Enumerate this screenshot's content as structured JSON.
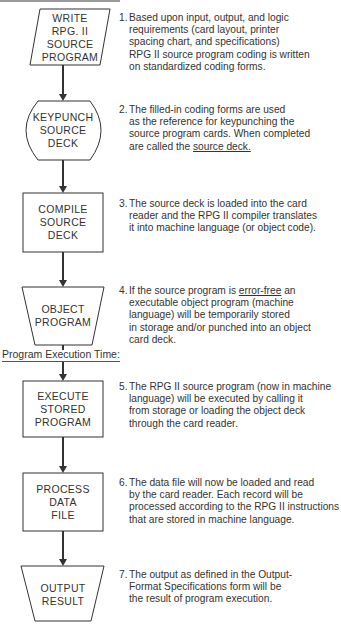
{
  "flowchart": {
    "shapes": [
      {
        "id": "write",
        "type": "parallelogram",
        "lines": [
          "WRITE",
          "RPG. II",
          "SOURCE",
          "PROGRAM"
        ]
      },
      {
        "id": "keypunch",
        "type": "offline-storage",
        "lines": [
          "KEYPUNCH",
          "SOURCE",
          "DECK"
        ]
      },
      {
        "id": "compile",
        "type": "rectangle",
        "lines": [
          "COMPILE",
          "SOURCE",
          "DECK"
        ]
      },
      {
        "id": "object",
        "type": "trapezoid",
        "lines": [
          "OBJECT",
          "PROGRAM"
        ]
      },
      {
        "id": "execute",
        "type": "rectangle",
        "lines": [
          "EXECUTE",
          "STORED",
          "PROGRAM"
        ]
      },
      {
        "id": "process",
        "type": "rectangle",
        "lines": [
          "PROCESS",
          "DATA",
          "FILE"
        ]
      },
      {
        "id": "output",
        "type": "trapezoid",
        "lines": [
          "OUTPUT",
          "RESULT"
        ]
      }
    ],
    "section_label": "Program Execution Time:",
    "line_color": "#333333"
  },
  "steps": [
    {
      "num": "1.",
      "lines": [
        "Based upon input, output, and logic",
        "requirements (card layout, printer",
        "spacing chart, and specifications)",
        "RPG II source program coding is written",
        "on standardized coding forms."
      ]
    },
    {
      "num": "2.",
      "lines": [
        "The filled-in coding forms are used",
        "as the reference for keypunching the",
        "source program cards. When completed"
      ],
      "last_prefix": "are called the ",
      "last_underlined": "source deck."
    },
    {
      "num": "3.",
      "lines": [
        "The source deck is loaded into the card",
        "reader and the RPG II compiler translates",
        "it into machine language (or object code)."
      ]
    },
    {
      "num": "4.",
      "first_prefix": "If the source program is ",
      "first_underlined": "error-free",
      "first_suffix": " an",
      "lines": [
        "executable object program (machine",
        "language) will be temporarily stored",
        "in storage and/or punched into an object",
        "card deck."
      ]
    },
    {
      "num": "5.",
      "lines": [
        "The RPG II source program (now in machine",
        "language) will be executed by calling it",
        "from storage or loading the object deck",
        "through the card reader."
      ]
    },
    {
      "num": "6.",
      "lines": [
        "The data file will now be loaded and read",
        "by the card reader. Each record will be",
        "processed according to the RPG II instructions",
        "that are stored in machine language."
      ]
    },
    {
      "num": "7.",
      "lines": [
        "The output as defined in the Output-",
        "Format Specifications form will be",
        "the result of program execution."
      ]
    }
  ]
}
